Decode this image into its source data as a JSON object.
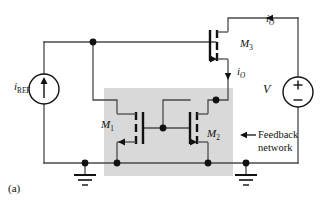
{
  "figure": {
    "caption": "(a)",
    "type": "circuit-schematic"
  },
  "colors": {
    "wire": "#4a4a4a",
    "device": "#111111",
    "shade": "#d8d8d8",
    "background": "#ffffff",
    "text": "#111111"
  },
  "labels": {
    "current_source": {
      "symbol": "i",
      "subscript": "REF",
      "name": "i-REF"
    },
    "transistor_m1": {
      "symbol": "M",
      "subscript": "1"
    },
    "transistor_m2": {
      "symbol": "M",
      "subscript": "2"
    },
    "transistor_m3": {
      "symbol": "M",
      "subscript": "3"
    },
    "output_current_top": {
      "symbol": "i",
      "subscript": "O"
    },
    "output_current_branch": {
      "symbol": "i",
      "subscript": "O"
    },
    "voltage_source": {
      "symbol": "V",
      "plus": "+",
      "minus": "−"
    },
    "feedback_network_line1": "Feedback",
    "feedback_network_line2": "network"
  },
  "components": [
    {
      "name": "current-source-iref",
      "kind": "current-source",
      "label": "i_REF",
      "direction": "up"
    },
    {
      "name": "transistor-m1",
      "kind": "mosfet",
      "label": "M1",
      "orientation": "mirrored"
    },
    {
      "name": "transistor-m2",
      "kind": "mosfet",
      "label": "M2",
      "orientation": "normal"
    },
    {
      "name": "transistor-m3",
      "kind": "mosfet",
      "label": "M3",
      "orientation": "normal"
    },
    {
      "name": "voltage-source-v",
      "kind": "voltage-source",
      "label": "V",
      "polarity_top": "+",
      "polarity_bottom": "-"
    },
    {
      "name": "ground-left",
      "kind": "ground"
    },
    {
      "name": "ground-right",
      "kind": "ground"
    },
    {
      "name": "feedback-network-box",
      "kind": "shaded-region",
      "label": "Feedback network"
    }
  ],
  "annotations": [
    {
      "name": "current-arrow-io-top",
      "label": "i_O",
      "direction": "left"
    },
    {
      "name": "current-arrow-io-branch",
      "label": "i_O",
      "direction": "down"
    },
    {
      "name": "feedback-pointer-arrow",
      "direction": "left"
    }
  ]
}
